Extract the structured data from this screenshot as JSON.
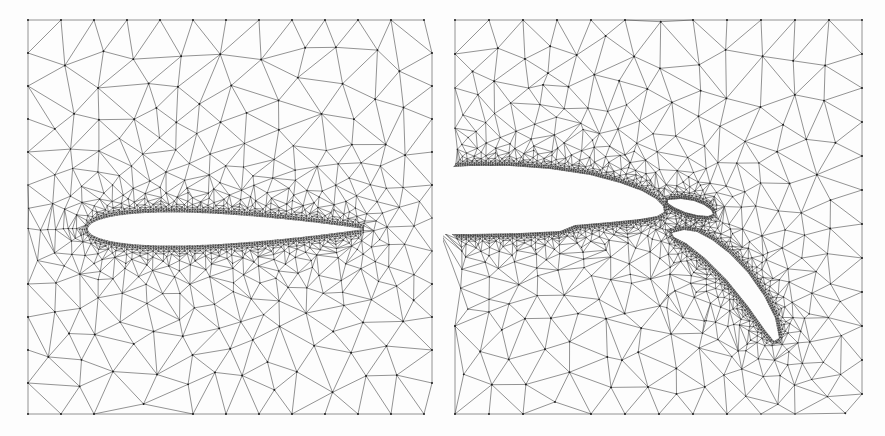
{
  "figure": {
    "kind": "unstructured-triangular-cfd-mesh",
    "background_color": "#fdfdfd",
    "edge_color": "#3a3a3a",
    "node_color": "#1d1d1d",
    "width": 885,
    "height": 436,
    "panel_count": 2
  },
  "panels": [
    {
      "id": "panel-left",
      "name": "single-element-airfoil-mesh",
      "label": "",
      "x": 0,
      "y": 0,
      "width": 443,
      "height": 436,
      "mesh_bounds": {
        "x0": 28,
        "y0": 20,
        "x1": 432,
        "y1": 414
      },
      "seed": 20137,
      "far_spacing": 33,
      "near_spacing": 2.6,
      "grading_power": 1.75,
      "wake_stretch": 1.0,
      "bodies": [
        {
          "name": "symmetric-airfoil",
          "type": "naca4-symmetric",
          "thickness": 0.12,
          "chord": 276,
          "leading_edge": [
            88,
            229
          ],
          "trailing_edge": [
            364,
            229
          ],
          "angle_deg": 0.6,
          "surface_points": 180
        }
      ]
    },
    {
      "id": "panel-right",
      "name": "multi-element-airfoil-flap-mesh",
      "label": "",
      "x": 443,
      "y": 0,
      "width": 442,
      "height": 436,
      "mesh_bounds": {
        "x0": 455,
        "y0": 20,
        "x1": 862,
        "y1": 414
      },
      "seed": 88413,
      "far_spacing": 34,
      "near_spacing": 2.3,
      "grading_power": 1.8,
      "wake_stretch": 1.0,
      "bodies": [
        {
          "name": "main-element-trailing-section",
          "type": "polygon",
          "points": [
            [
              440,
              168
            ],
            [
              470,
              166
            ],
            [
              510,
              166
            ],
            [
              550,
              169
            ],
            [
              590,
              175
            ],
            [
              620,
              183
            ],
            [
              642,
              191
            ],
            [
              656,
              199
            ],
            [
              663,
              206
            ],
            [
              664,
              212
            ],
            [
              657,
              216
            ],
            [
              640,
              219
            ],
            [
              610,
              222
            ],
            [
              575,
              225
            ],
            [
              560,
              231
            ],
            [
              520,
              233
            ],
            [
              470,
              234
            ],
            [
              440,
              234
            ]
          ]
        },
        {
          "name": "upper-slat-element",
          "type": "polygon",
          "points": [
            [
              668,
              200
            ],
            [
              681,
              199
            ],
            [
              694,
              201
            ],
            [
              704,
              205
            ],
            [
              711,
              210
            ],
            [
              713,
              214
            ],
            [
              708,
              216
            ],
            [
              697,
              215
            ],
            [
              685,
              212
            ],
            [
              674,
              207
            ],
            [
              668,
              203
            ]
          ]
        },
        {
          "name": "main-flap-element",
          "type": "polygon",
          "points": [
            [
              672,
              233
            ],
            [
              684,
              230
            ],
            [
              697,
              232
            ],
            [
              712,
              240
            ],
            [
              730,
              254
            ],
            [
              748,
              273
            ],
            [
              764,
              296
            ],
            [
              775,
              318
            ],
            [
              779,
              338
            ],
            [
              774,
              341
            ],
            [
              765,
              330
            ],
            [
              748,
              306
            ],
            [
              727,
              280
            ],
            [
              705,
              258
            ],
            [
              686,
              243
            ],
            [
              674,
              237
            ]
          ]
        }
      ]
    }
  ],
  "rendering": {
    "triangle_edge_opacity": 0.92,
    "node_radius_far": 0.95,
    "node_radius_near": 0.55,
    "show_nodes": true,
    "show_edges": true
  }
}
